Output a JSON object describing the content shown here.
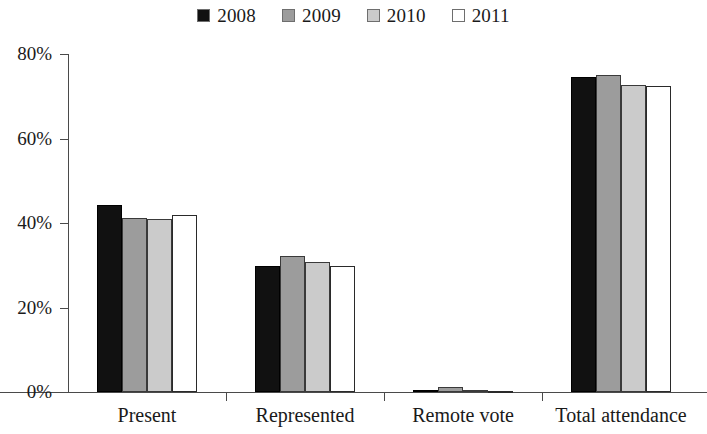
{
  "chart_data": {
    "type": "bar",
    "title": "",
    "subtitle": "",
    "xlabel": "",
    "ylabel": "",
    "categories": [
      "Present",
      "Represented",
      "Remote vote",
      "Total attendance"
    ],
    "series": [
      {
        "name": "2008",
        "color": "#111111",
        "values": [
          44.3,
          29.8,
          0.4,
          74.6
        ]
      },
      {
        "name": "2009",
        "color": "#9c9c9c",
        "values": [
          41.2,
          32.3,
          1.1,
          75.0
        ]
      },
      {
        "name": "2010",
        "color": "#cbcbcb",
        "values": [
          41.0,
          30.8,
          0.5,
          72.7
        ]
      },
      {
        "name": "2011",
        "color": "#ffffff",
        "values": [
          42.0,
          29.9,
          0.3,
          72.5
        ]
      }
    ],
    "ylim": [
      0,
      80
    ],
    "yticks": [
      0,
      20,
      40,
      60,
      80
    ],
    "ytick_labels": [
      "0%",
      "20%",
      "40%",
      "60%",
      "80%"
    ],
    "grid": false,
    "legend_position": "top-center",
    "legend_entries": [
      "2008",
      "2009",
      "2010",
      "2011"
    ],
    "value_suffix": "%"
  }
}
